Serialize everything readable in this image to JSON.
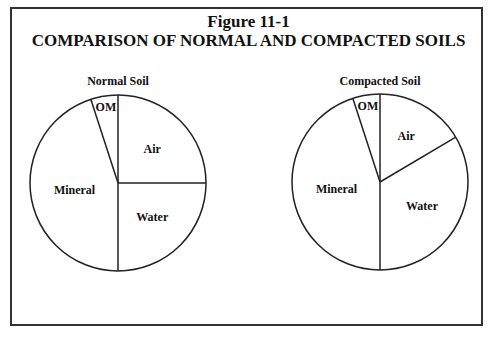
{
  "figure": {
    "label": "Figure 11-1",
    "title": "COMPARISON OF NORMAL AND COMPACTED SOILS"
  },
  "chart_data": [
    {
      "type": "pie",
      "title": "Normal Soil",
      "categories": [
        "Air",
        "Water",
        "Mineral",
        "OM"
      ],
      "values": [
        25,
        25,
        45,
        5
      ],
      "start": "12 o'clock, clockwise"
    },
    {
      "type": "pie",
      "title": "Compacted Soil",
      "categories": [
        "Air",
        "Water",
        "Mineral",
        "OM"
      ],
      "values": [
        16.5,
        33.5,
        45,
        5
      ],
      "start": "12 o'clock, clockwise"
    }
  ],
  "colors": {
    "line": "#222222",
    "fill": "#ffffff"
  }
}
